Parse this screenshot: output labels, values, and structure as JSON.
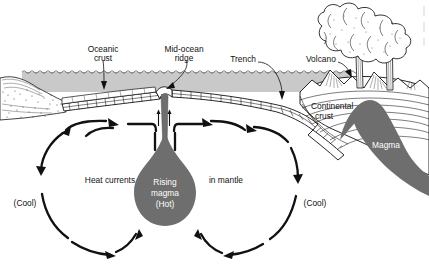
{
  "figure": {
    "type": "diagram",
    "background_color": "#ffffff",
    "ink_color": "#111111",
    "water_color": "#c8c8c8",
    "magma_color": "#6e6e6e",
    "crust_fill": "#ffffff"
  },
  "labels": {
    "oceanic_crust": "Oceanic\ncrust",
    "oceanic_crust_line1": "Oceanic",
    "oceanic_crust_line2": "crust",
    "mid_ocean_ridge_line1": "Mid-ocean",
    "mid_ocean_ridge_line2": "ridge",
    "trench": "Trench",
    "volcano": "Volcano",
    "continental_crust_line1": "Continental",
    "continental_crust_line2": "crust",
    "magma": "Magma",
    "heat_currents": "Heat currents",
    "in_mantle": "in mantle",
    "rising_magma_line1": "Rising",
    "rising_magma_line2": "magma",
    "rising_magma_line3": "(Hot)",
    "cool_left": "(Cool)",
    "cool_right": "(Cool)"
  },
  "features": [
    {
      "name": "ocean-water-band",
      "description": "gray seawater layer spanning the ocean basin"
    },
    {
      "name": "oceanic-crust-slab",
      "description": "hatched brick-pattern plate on both sides of ridge"
    },
    {
      "name": "mid-ocean-ridge",
      "description": "central spreading ridge with magma conduit"
    },
    {
      "name": "upwelling-arrows",
      "description": "two thin upward arrows in ridge conduit"
    },
    {
      "name": "subduction-trench",
      "description": "plate descending beneath continent"
    },
    {
      "name": "continental-landmass-left",
      "description": "stippled land with folded strata at far left"
    },
    {
      "name": "continental-landmass-right",
      "description": "continent with volcanoes and folded strata"
    },
    {
      "name": "volcano-pair",
      "description": "two erupting volcanoes with ash plumes"
    },
    {
      "name": "magma-chamber",
      "description": "dark magma body feeding volcanoes"
    },
    {
      "name": "mantle-plume",
      "description": "teardrop of rising hot magma beneath ridge"
    },
    {
      "name": "convection-cell-left",
      "description": "counter-clockwise heat current loop"
    },
    {
      "name": "convection-cell-right",
      "description": "clockwise heat current loop"
    }
  ]
}
